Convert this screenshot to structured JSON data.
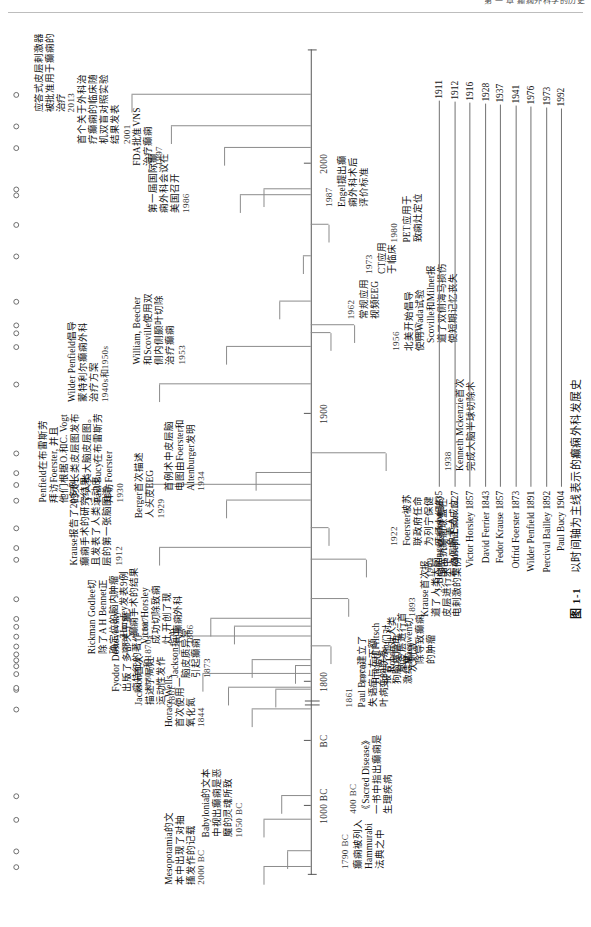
{
  "page_header": "第 一 章   癫痫外科学的历史",
  "figure": {
    "caption_number": "图 1-1",
    "caption_text": "以时间轴为主线表示的癫痫外科发展史"
  },
  "axis": {
    "ticks": [
      {
        "label": "2000"
      },
      {
        "label": "1900"
      },
      {
        "label": "1800"
      },
      {
        "label": "BC"
      },
      {
        "label": "1000 BC"
      }
    ]
  },
  "events": [
    {
      "id": "e2000bc",
      "year": "2000 BC",
      "text": "Mesopotamia的文\n本中出现了对抽\n搐发作的记载"
    },
    {
      "id": "e1790bc",
      "year": "1790 BC",
      "text": "癫痫被列入\nHammurabi\n法典之中"
    },
    {
      "id": "e1050bc",
      "year": "1050 BC",
      "text": "Babylonia的文本\n中视出癫痫是恶\n魔的灵魂所致"
    },
    {
      "id": "e400bc",
      "year": "400 BC",
      "text": "《Sacred Disease》\n一书中指出癫痫是\n生理疾病"
    },
    {
      "id": "e1844",
      "year": "1844",
      "text": "Horace Wells\n首次使用一\n氧化氮"
    },
    {
      "id": "e1861",
      "year": "1861",
      "text": "Paul Broca建立了\n失语症与左下额\n叶病变的联系"
    },
    {
      "id": "e1861b",
      "year": "1861",
      "text": "Jackson首次\n描述了局灶\n运动性发作"
    },
    {
      "id": "e1860s70s",
      "year": "1860s和1870s",
      "text": "Fyodor Dostoyevsky\n出版了多部关于癫\n痫特征的著作"
    },
    {
      "id": "e1870",
      "year": "1870",
      "text": "Hitzig和Fritsch\n报告了他们对\n狗脑皮层电\n激结果"
    },
    {
      "id": "e1873",
      "year": "1873",
      "text": "Jackson指出\n脑皮质异常\n引起癫痫"
    },
    {
      "id": "e1874",
      "year": "1874",
      "text": "Robert对人类\n脑皮层进行首\n次刺激"
    },
    {
      "id": "e1879",
      "year": "1879",
      "text": "Macewen切\n除导致癫痫\n的肿瘤"
    },
    {
      "id": "e1884",
      "year": "1884",
      "text": "Rickman Godlee切\n除了A H Bennet正\n确定位的脑内肿瘤"
    },
    {
      "id": "e1886",
      "year": "1886",
      "text": "Victor Horsley\n成功切除致痫\n灶,开创了现\n代癫痫外科"
    },
    {
      "id": "e1887",
      "year": "1887",
      "text": "Horsley发表9例\n癫痫手术的结果"
    },
    {
      "id": "e1893",
      "year": "1893",
      "text": "Krause首次报\n道了人类大脑\n皮层进行术中\n电刺激的案例"
    },
    {
      "id": "e1909",
      "year": "1909",
      "text": "国际抗癫痫联盟在\n布达佩斯正式成立"
    },
    {
      "id": "e1912",
      "year": "1912",
      "text": "Krause报告了20多例\n癫痫手术的研究结果,\n且发表了人类运动皮\n层的第一张脑图谱"
    },
    {
      "id": "e1922",
      "year": "1922",
      "text": "Foerster被苏\n联政府任命\n为列宁保健\n医师小组的\n负责人"
    },
    {
      "id": "e1929",
      "year": "1929",
      "text": "Berger首次描述\n人头皮EEG"
    },
    {
      "id": "e1930",
      "year": "1930",
      "text": "Penfield在布雷斯劳\n拜访Foerster, 并且\n他们根据O.和C. Vogt\n的灵长类皮层图发布\n了人类大脑皮层图。\nPaul Bucy在布雷斯劳\n拜访Foerster"
    },
    {
      "id": "e1934",
      "year": "1934",
      "text": "首例术中皮层脑\n电图由Foerster和\nAltenburger发明"
    },
    {
      "id": "e1938",
      "year": "1938",
      "text": "Kenneth Mckenzie首次\n完成大脑半球切除术"
    },
    {
      "id": "e1940s50s",
      "year": "1940s和1950s",
      "text": "Wilder Penfield倡导\n蒙特利尔癫痫外科\n治疗方案"
    },
    {
      "id": "e1953",
      "year": "1953",
      "text": "William, Beecher\n和Scoville使用双\n侧内侧颞叶切除\n治疗癫痫"
    },
    {
      "id": "e1956",
      "year": "1956",
      "text": "北美开始倡导\n使用Wada试验"
    },
    {
      "id": "e1957",
      "year": "1957",
      "text": "Scoville和Milner报\n道了双侧海马损伤\n使短期记忆丧失"
    },
    {
      "id": "e1962",
      "year": "1962",
      "text": "常规应用\n视频EEG"
    },
    {
      "id": "e1973",
      "year": "1973",
      "text": "CT应用\n于临床"
    },
    {
      "id": "e1980",
      "year": "1980",
      "text": "PET应用于\n致痫灶定位"
    },
    {
      "id": "e1986",
      "year": "1986",
      "text": "第一届国际癫\n痫外科会议在\n美国召开"
    },
    {
      "id": "e1987",
      "year": "1987",
      "text": "Engel提出癫\n痫外科术后\n评价标准"
    },
    {
      "id": "e1997",
      "year": "1997",
      "text": "FDA批准VNS\n治疗癫痫"
    },
    {
      "id": "e2001",
      "year": "2001",
      "text": "首个关于外科治\n疗癫痫的临床随\n机双盲对照实验\n结果发表"
    },
    {
      "id": "e2013",
      "year": "2013",
      "text": "应答式皮层刺激器\n被批准用于癫痫的\n治疗"
    }
  ],
  "roster": [
    {
      "name": "J. Hughlings Jackson 1835",
      "end": "1911"
    },
    {
      "name": "Joseph Lister 1827",
      "end": "1912"
    },
    {
      "name": "Victor Horsley 1857",
      "end": "1916"
    },
    {
      "name": "David Ferrier 1843",
      "end": "1928"
    },
    {
      "name": "Fedor Krause 1857",
      "end": "1937"
    },
    {
      "name": "Otfrid Foerster 1873",
      "end": "1941"
    },
    {
      "name": "Wilder Penfield 1891",
      "end": "1976"
    },
    {
      "name": "Percival Bailley 1892",
      "end": "1973"
    },
    {
      "name": "Paul Bucy 1904",
      "end": "1992"
    }
  ]
}
